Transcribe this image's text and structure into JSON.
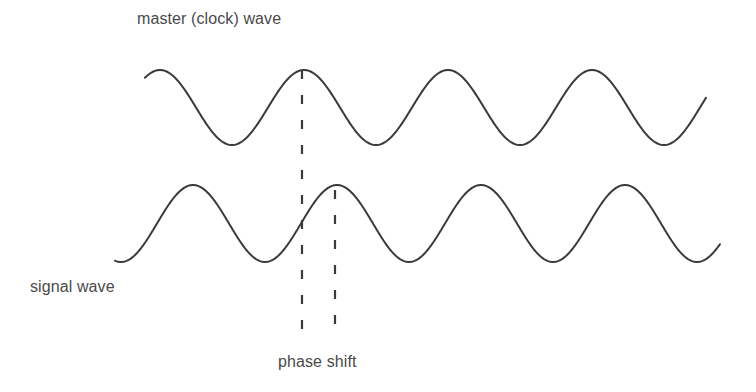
{
  "labels": {
    "master": "master (clock) wave",
    "signal": "signal wave",
    "phase_shift": "phase shift"
  },
  "colors": {
    "background": "#ffffff",
    "wave_stroke": "#3a3a3a",
    "text": "#4a4a4a"
  },
  "waves": {
    "master": {
      "name": "master (clock) wave",
      "x_start": 145,
      "x_end": 706,
      "peak_y": 70,
      "trough_y": 145,
      "period_px": 144,
      "first_peak_x": 160
    },
    "signal": {
      "name": "signal wave",
      "x_start": 115,
      "x_end": 720,
      "peak_y": 185,
      "trough_y": 262,
      "period_px": 144,
      "first_peak_x": 193
    }
  },
  "markers": {
    "master_peak_line": {
      "x": 302,
      "y_start": 70,
      "y_end": 336
    },
    "signal_peak_line": {
      "x": 335,
      "y_start": 190,
      "y_end": 336
    }
  }
}
